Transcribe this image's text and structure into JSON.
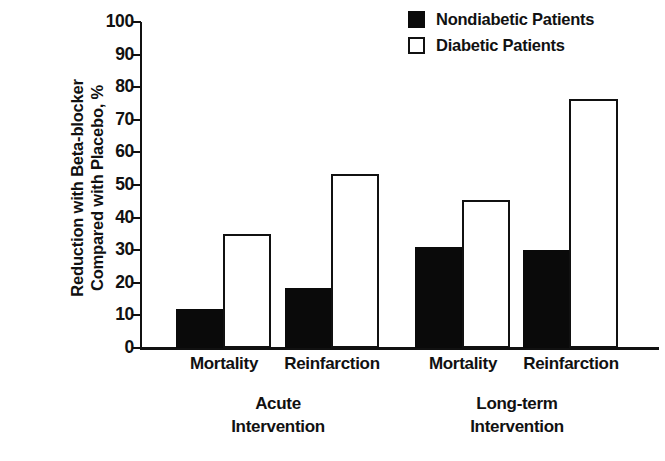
{
  "chart_data": {
    "type": "bar",
    "title": "",
    "xlabel": "",
    "ylabel": "Reduction with Beta-blocker Compared with Placebo, %",
    "ylabel_lines": [
      "Reduction with Beta-blocker",
      "Compared with Placebo, %"
    ],
    "ylim": [
      0,
      100
    ],
    "ytick_labels": [
      "100",
      "90",
      "80",
      "70",
      "60",
      "50",
      "40",
      "30",
      "20",
      "10",
      "0"
    ],
    "ytick_values": [
      100,
      90,
      80,
      70,
      60,
      50,
      40,
      30,
      20,
      10,
      0
    ],
    "grid": false,
    "legend_position": "top-right",
    "categories": [
      "Mortality",
      "Reinfarction",
      "Mortality",
      "Reinfarction"
    ],
    "groups": [
      {
        "label_lines": [
          "Acute",
          "Intervention"
        ],
        "label": "Acute Intervention",
        "categories": [
          "Mortality",
          "Reinfarction"
        ]
      },
      {
        "label_lines": [
          "Long-term",
          "Intervention"
        ],
        "label": "Long-term Intervention",
        "categories": [
          "Mortality",
          "Reinfarction"
        ]
      }
    ],
    "series": [
      {
        "name": "Nondiabetic Patients",
        "style": "filled",
        "color": "#0a0a0a",
        "values": [
          12,
          18.5,
          31,
          30
        ]
      },
      {
        "name": "Diabetic Patients",
        "style": "open",
        "color": "#ffffff",
        "values": [
          35,
          53.5,
          45.5,
          76.5
        ]
      }
    ],
    "bars": [
      {
        "group": "Acute Intervention",
        "category": "Mortality",
        "series": "Nondiabetic Patients",
        "value": 12,
        "style": "filled",
        "x": 36,
        "width": 47
      },
      {
        "group": "Acute Intervention",
        "category": "Mortality",
        "series": "Diabetic Patients",
        "value": 35,
        "style": "open",
        "x": 83,
        "width": 48
      },
      {
        "group": "Acute Intervention",
        "category": "Reinfarction",
        "series": "Nondiabetic Patients",
        "value": 18.5,
        "style": "filled",
        "x": 145,
        "width": 46
      },
      {
        "group": "Acute Intervention",
        "category": "Reinfarction",
        "series": "Diabetic Patients",
        "value": 53.5,
        "style": "open",
        "x": 191,
        "width": 48
      },
      {
        "group": "Long-term Intervention",
        "category": "Mortality",
        "series": "Nondiabetic Patients",
        "value": 31,
        "style": "filled",
        "x": 275,
        "width": 47
      },
      {
        "group": "Long-term Intervention",
        "category": "Mortality",
        "series": "Diabetic Patients",
        "value": 45.5,
        "style": "open",
        "x": 322,
        "width": 48
      },
      {
        "group": "Long-term Intervention",
        "category": "Reinfarction",
        "series": "Nondiabetic Patients",
        "value": 30,
        "style": "filled",
        "x": 383,
        "width": 46
      },
      {
        "group": "Long-term Intervention",
        "category": "Reinfarction",
        "series": "Diabetic Patients",
        "value": 76.5,
        "style": "open",
        "x": 429,
        "width": 49
      }
    ]
  },
  "legend": {
    "items": [
      {
        "label": "Nondiabetic Patients",
        "style": "filled"
      },
      {
        "label": "Diabetic Patients",
        "style": "open"
      }
    ]
  },
  "axis": {
    "y_title_line1": "Reduction with Beta-blocker",
    "y_title_line2": "Compared with Placebo, %"
  },
  "category_labels": [
    {
      "text": "Mortality",
      "center": 84
    },
    {
      "text": "Reinfarction",
      "center": 192
    },
    {
      "text": "Mortality",
      "center": 323
    },
    {
      "text": "Reinfarction",
      "center": 431
    }
  ],
  "group_labels": [
    {
      "line1": "Acute",
      "line2": "Intervention",
      "center": 138
    },
    {
      "line1": "Long-term",
      "line2": "Intervention",
      "center": 377
    }
  ]
}
